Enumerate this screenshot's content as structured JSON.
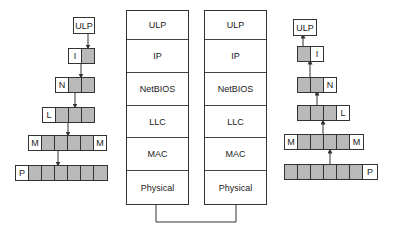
{
  "left_encapsulation": {
    "top_label": "ULP",
    "rows": [
      {
        "header": "I",
        "header_side": "left",
        "cells": 1
      },
      {
        "header": "N",
        "header_side": "left",
        "cells": 2
      },
      {
        "header": "L",
        "header_side": "left",
        "cells": 3
      },
      {
        "header": "M",
        "trailer": "M",
        "cells": 4
      },
      {
        "header": "P",
        "header_side": "left",
        "cells": 6
      }
    ]
  },
  "stacks": {
    "layers": [
      "ULP",
      "IP",
      "NetBIOS",
      "LLC",
      "MAC",
      "Physical"
    ],
    "left": {
      "layers": [
        "ULP",
        "IP",
        "NetBIOS",
        "LLC",
        "MAC",
        "Physical"
      ]
    },
    "right": {
      "layers": [
        "ULP",
        "IP",
        "NetBIOS",
        "LLC",
        "MAC",
        "Physical"
      ]
    }
  },
  "right_decapsulation": {
    "top_label": "ULP",
    "rows": [
      {
        "header": "I",
        "header_side": "right",
        "cells": 1
      },
      {
        "header": "N",
        "header_side": "right",
        "cells": 2
      },
      {
        "header": "L",
        "header_side": "right",
        "cells": 3
      },
      {
        "header": "M",
        "trailer": "M",
        "cells": 4
      },
      {
        "header": "P",
        "header_side": "right",
        "cells": 6
      }
    ]
  },
  "colors": {
    "payload_fill": "#b9b9b9",
    "line": "#333333",
    "background": "#ffffff"
  }
}
